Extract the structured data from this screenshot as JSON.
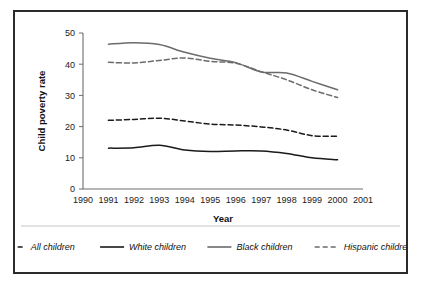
{
  "chart_data": {
    "type": "line",
    "title": "",
    "xlabel": "Year",
    "ylabel": "Child poverty rate",
    "xlim": [
      1990,
      2001
    ],
    "ylim": [
      0,
      50
    ],
    "grid": false,
    "legend_position": "bottom",
    "x": [
      1991,
      1992,
      1993,
      1994,
      1995,
      1996,
      1997,
      1998,
      1999,
      2000
    ],
    "xticks": [
      "1990",
      "1991",
      "1992",
      "1993",
      "1994",
      "1995",
      "1996",
      "1997",
      "1998",
      "1999",
      "2000",
      "2001"
    ],
    "yticks": [
      "0",
      "10",
      "20",
      "30",
      "40",
      "50"
    ],
    "series": [
      {
        "name": "All children",
        "style": "dashed",
        "color": "#1a1a1a",
        "values": [
          22.0,
          22.3,
          22.7,
          21.8,
          20.8,
          20.5,
          19.9,
          18.9,
          17.1,
          16.9
        ]
      },
      {
        "name": "White children",
        "style": "solid",
        "color": "#1a1a1a",
        "values": [
          13.1,
          13.2,
          14.0,
          12.5,
          12.0,
          12.2,
          12.2,
          11.4,
          10.0,
          9.4
        ]
      },
      {
        "name": "Black children",
        "style": "solid",
        "color": "#6b6b6b",
        "values": [
          46.4,
          46.9,
          46.3,
          43.8,
          41.9,
          40.5,
          37.5,
          37.2,
          34.5,
          31.8
        ]
      },
      {
        "name": "Hispanic children",
        "style": "dashed",
        "color": "#6b6b6b",
        "values": [
          40.6,
          40.4,
          41.2,
          42.0,
          40.9,
          40.3,
          37.6,
          35.0,
          31.8,
          29.3
        ]
      }
    ]
  },
  "legend": {
    "items": [
      {
        "label": "All children",
        "style": "dashed",
        "color": "#1a1a1a"
      },
      {
        "label": "White children",
        "style": "solid",
        "color": "#1a1a1a"
      },
      {
        "label": "Black children",
        "style": "solid",
        "color": "#6b6b6b"
      },
      {
        "label": "Hispanic children",
        "style": "dashed",
        "color": "#6b6b6b"
      }
    ]
  }
}
